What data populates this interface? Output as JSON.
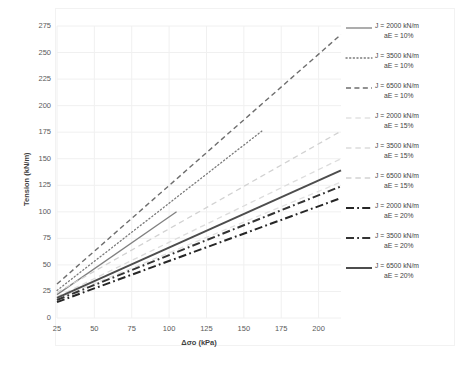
{
  "chart_data": {
    "type": "line",
    "title": "",
    "xlabel": "Δσo (kPa)",
    "ylabel": "Tension (kN/m)",
    "xlim": [
      25,
      215
    ],
    "ylim": [
      0,
      275
    ],
    "xticks": [
      25,
      50,
      75,
      100,
      125,
      150,
      175,
      200
    ],
    "yticks": [
      0,
      25,
      50,
      75,
      100,
      125,
      150,
      175,
      200,
      225,
      250,
      275
    ],
    "grid": true,
    "legend_position": "right",
    "series": [
      {
        "name": "J = 2000 kN/m aE = 10%",
        "J": 2000,
        "aE": "10%",
        "style": "solid",
        "color": "#808080",
        "width": 1.3,
        "x": [
          25,
          105
        ],
        "y": [
          22,
          100
        ]
      },
      {
        "name": "J = 3500 kN/m aE = 10%",
        "J": 3500,
        "aE": "10%",
        "style": "dotted",
        "color": "#7a7a7a",
        "width": 1.3,
        "x": [
          25,
          162
        ],
        "y": [
          26,
          176
        ]
      },
      {
        "name": "J = 6500 kN/m aE = 10%",
        "J": 6500,
        "aE": "10%",
        "style": "dashed",
        "color": "#6e6e6e",
        "width": 1.4,
        "x": [
          25,
          215
        ],
        "y": [
          32,
          267
        ]
      },
      {
        "name": "J = 2000 kN/m aE = 15%",
        "J": 2000,
        "aE": "15%",
        "style": "dashed-light",
        "color": "#e2e2e2",
        "width": 1.3,
        "x": [
          25,
          215
        ],
        "y": [
          18,
          128
        ]
      },
      {
        "name": "J = 3500 kN/m aE = 15%",
        "J": 3500,
        "aE": "15%",
        "style": "dashed-light",
        "color": "#dcdcdc",
        "width": 1.3,
        "x": [
          25,
          215
        ],
        "y": [
          20,
          150
        ]
      },
      {
        "name": "J = 6500 kN/m aE = 15%",
        "J": 6500,
        "aE": "15%",
        "style": "dashed-light",
        "color": "#d2d2d2",
        "width": 1.3,
        "x": [
          25,
          215
        ],
        "y": [
          24,
          176
        ]
      },
      {
        "name": "J = 2000 kN/m aE = 20%",
        "J": 2000,
        "aE": "20%",
        "style": "dash-dot",
        "color": "#262626",
        "width": 2.0,
        "x": [
          25,
          215
        ],
        "y": [
          15,
          113
        ]
      },
      {
        "name": "J = 3500 kN/m aE = 20%",
        "J": 3500,
        "aE": "20%",
        "style": "dash-dot",
        "color": "#333333",
        "width": 2.0,
        "x": [
          25,
          215
        ],
        "y": [
          17,
          124
        ]
      },
      {
        "name": "J = 6500 kN/m aE = 20%",
        "J": 6500,
        "aE": "20%",
        "style": "solid",
        "color": "#4d4d4d",
        "width": 2.0,
        "x": [
          25,
          215
        ],
        "y": [
          19,
          139
        ]
      }
    ]
  },
  "legend": {
    "entries": [
      {
        "line1": "J = 2000 kN/m",
        "line2": "aE = 10%"
      },
      {
        "line1": "J = 3500 kN/m",
        "line2": "aE = 10%"
      },
      {
        "line1": "J = 6500 kN/m",
        "line2": "aE = 10%"
      },
      {
        "line1": "J = 2000 kN/m",
        "line2": "aE = 15%"
      },
      {
        "line1": "J = 3500 kN/m",
        "line2": "aE = 15%"
      },
      {
        "line1": "J = 6500 kN/m",
        "line2": "aE = 15%"
      },
      {
        "line1": "J = 2000 kN/m",
        "line2": "aE = 20%"
      },
      {
        "line1": "J = 3500 kN/m",
        "line2": "aE = 20%"
      },
      {
        "line1": "J = 6500 kN/m",
        "line2": "aE = 20%"
      }
    ]
  },
  "colors": {
    "grid": "#f0f0f0",
    "axis_text": "#5a5a5a",
    "border": "#f2f2f2"
  }
}
